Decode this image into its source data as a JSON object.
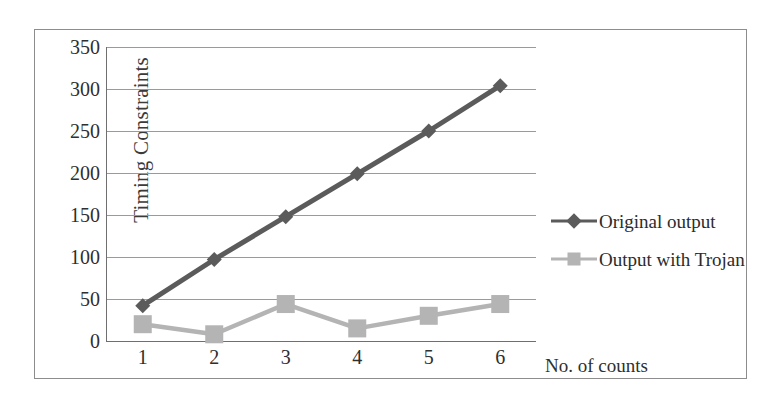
{
  "chart_data": {
    "type": "line",
    "title": "",
    "xlabel": "No. of counts",
    "ylabel": "Timing Constraints",
    "categories": [
      "1",
      "2",
      "3",
      "4",
      "5",
      "6"
    ],
    "x": [
      1,
      2,
      3,
      4,
      5,
      6
    ],
    "xlim": [
      0.5,
      6.5
    ],
    "ylim": [
      0,
      350
    ],
    "ytick_labels": [
      "0",
      "50",
      "100",
      "150",
      "200",
      "250",
      "300",
      "350"
    ],
    "yticks": [
      0,
      50,
      100,
      150,
      200,
      250,
      300,
      350
    ],
    "grid": "horizontal",
    "legend_position": "right",
    "series": [
      {
        "name": "Original output",
        "values": [
          42,
          97,
          148,
          199,
          250,
          304
        ],
        "color": "#5b5b5b",
        "marker": "diamond"
      },
      {
        "name": "Output with Trojan",
        "values": [
          20,
          8,
          44,
          15,
          30,
          44
        ],
        "color": "#b4b4b4",
        "marker": "square"
      }
    ]
  },
  "axis": {
    "y_title": "Timing Constraints",
    "x_title": "No. of counts"
  },
  "legend": {
    "items": [
      {
        "label": "Original output",
        "marker": "diamond-marker-icon"
      },
      {
        "label": "Output with Trojan",
        "marker": "square-marker-icon"
      }
    ]
  },
  "colors": {
    "series_original": "#5b5b5b",
    "series_trojan": "#b4b4b4",
    "gridline": "#9a9a9a",
    "axis": "#6f6f6f",
    "frame": "#8d8d8d",
    "text": "#2f2f2f"
  }
}
